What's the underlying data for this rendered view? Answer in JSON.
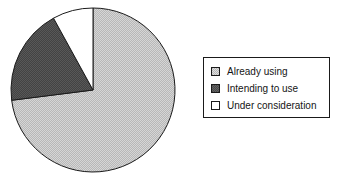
{
  "chart_data": {
    "type": "pie",
    "title": "",
    "labels": [
      "Already using",
      "Intending to use",
      "Under consideration"
    ],
    "values": [
      73,
      19,
      8
    ],
    "unit": "%",
    "colors": [
      "#b8b8b8",
      "#4a4a4a",
      "#ffffff"
    ],
    "outline_color": "#1a1a1a",
    "start_angle_deg": 0,
    "direction": "clockwise",
    "center": {
      "x": 93,
      "y": 90
    },
    "radius": 82,
    "legend": {
      "position": "right",
      "border_color": "#1a1a1a",
      "background": "#ffffff",
      "entries": [
        {
          "label": "Already using",
          "color": "#b8b8b8",
          "swatch": "light-gray-hatched"
        },
        {
          "label": "Intending to use",
          "color": "#4a4a4a",
          "swatch": "dark-gray-hatched"
        },
        {
          "label": "Under consideration",
          "color": "#ffffff",
          "swatch": "white"
        }
      ]
    },
    "grid": false,
    "xlabel": "",
    "ylabel": ""
  }
}
